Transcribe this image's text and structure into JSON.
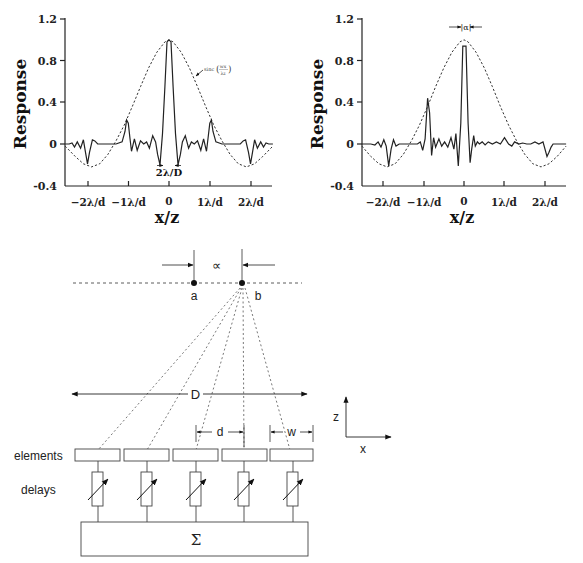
{
  "chart_data": [
    {
      "type": "line",
      "id": "left",
      "title": "",
      "xlabel": "x/z",
      "ylabel": "Response",
      "ylim": [
        -0.4,
        1.2
      ],
      "yticks": [
        1.2,
        0.8,
        0.4,
        0,
        -0.4
      ],
      "ytick_labels": [
        "1.2",
        "0.8",
        "0.4",
        "0",
        "-0.4"
      ],
      "xticks": [
        -2,
        -1,
        0,
        1,
        2
      ],
      "xtick_labels": [
        "−2λ/d",
        "−1λ/d",
        "0",
        "1λ/d",
        "2λ/d"
      ],
      "xlim": [
        -2.55,
        2.55
      ],
      "grid": false,
      "annotations": [
        {
          "text": "sinc(wx/λz)",
          "target": "envelope",
          "x": 1.0,
          "y": 0.74
        },
        {
          "text": "2λ/D",
          "x": 0,
          "y": -0.26,
          "kind": "mainlobe-width"
        }
      ],
      "series": [
        {
          "name": "envelope sinc(wx/λz)",
          "style": "dashed",
          "x": [
            -2.55,
            -2.3,
            -2.1,
            -1.9,
            -1.7,
            -1.5,
            -1.3,
            -1.1,
            -0.9,
            -0.7,
            -0.5,
            -0.3,
            -0.1,
            0,
            0.1,
            0.3,
            0.5,
            0.7,
            0.9,
            1.1,
            1.3,
            1.5,
            1.7,
            1.9,
            2.1,
            2.3,
            2.55
          ],
          "y": [
            -0.02,
            -0.12,
            -0.19,
            -0.22,
            -0.19,
            -0.1,
            0.03,
            0.18,
            0.36,
            0.55,
            0.73,
            0.88,
            0.98,
            1.0,
            0.98,
            0.88,
            0.73,
            0.55,
            0.36,
            0.18,
            0.03,
            -0.1,
            -0.19,
            -0.22,
            -0.19,
            -0.12,
            -0.02
          ]
        },
        {
          "name": "array response",
          "style": "solid",
          "x": [
            -2.55,
            -2.45,
            -2.38,
            -2.32,
            -2.25,
            -2.17,
            -2.1,
            -2.05,
            -2.0,
            -1.95,
            -1.88,
            -1.82,
            -1.75,
            -1.65,
            -1.5,
            -1.3,
            -1.15,
            -1.08,
            -1.04,
            -1.0,
            -0.96,
            -0.92,
            -0.85,
            -0.78,
            -0.7,
            -0.62,
            -0.55,
            -0.48,
            -0.4,
            -0.33,
            -0.28,
            -0.22,
            -0.16,
            -0.1,
            -0.05,
            0,
            0.05,
            0.1,
            0.16,
            0.22,
            0.28,
            0.33,
            0.4,
            0.48,
            0.55,
            0.62,
            0.7,
            0.78,
            0.85,
            0.92,
            0.96,
            1.0,
            1.04,
            1.08,
            1.15,
            1.3,
            1.5,
            1.65,
            1.75,
            1.82,
            1.88,
            1.95,
            2.0,
            2.05,
            2.1,
            2.17,
            2.25,
            2.32,
            2.38,
            2.45,
            2.55
          ],
          "y": [
            0,
            0.0,
            0.01,
            -0.03,
            0.02,
            -0.04,
            0.04,
            -0.08,
            -0.19,
            -0.08,
            0.04,
            0.03,
            0.0,
            0.0,
            0.0,
            0.0,
            0.02,
            0.12,
            0.23,
            0.2,
            0.06,
            -0.07,
            0.05,
            -0.06,
            0.03,
            0.0,
            0.02,
            -0.04,
            0.08,
            0.02,
            -0.1,
            -0.2,
            0.1,
            0.55,
            0.98,
            1.0,
            0.98,
            0.55,
            0.1,
            -0.2,
            -0.1,
            0.02,
            0.08,
            -0.04,
            0.02,
            0.0,
            0.03,
            -0.06,
            0.05,
            -0.07,
            0.06,
            0.2,
            0.23,
            0.12,
            0.02,
            0.0,
            0.0,
            0.0,
            0.0,
            0.03,
            0.04,
            -0.08,
            -0.19,
            -0.08,
            0.04,
            -0.04,
            0.02,
            -0.03,
            0.01,
            0.0,
            0.0
          ]
        }
      ]
    },
    {
      "type": "line",
      "id": "right",
      "title": "",
      "xlabel": "x/z",
      "ylabel": "Response",
      "ylim": [
        -0.4,
        1.2
      ],
      "yticks": [
        1.2,
        0.8,
        0.4,
        0,
        -0.4
      ],
      "ytick_labels": [
        "1.2",
        "0.8",
        "0.4",
        "0",
        "-0.4"
      ],
      "xticks": [
        -2,
        -1,
        0,
        1,
        2
      ],
      "xtick_labels": [
        "−2λ/d",
        "−1λ/d",
        "0",
        "1λ/d",
        "2λ/d"
      ],
      "xlim": [
        -2.52,
        2.52
      ],
      "grid": false,
      "annotations": [
        {
          "text": "|α|",
          "x": 0.1,
          "y": 1.12,
          "kind": "offset-width"
        }
      ],
      "series": [
        {
          "name": "envelope sinc",
          "style": "dashed",
          "x": [
            -2.52,
            -2.3,
            -2.1,
            -1.9,
            -1.7,
            -1.5,
            -1.3,
            -1.1,
            -0.9,
            -0.7,
            -0.5,
            -0.3,
            -0.1,
            0,
            0.1,
            0.3,
            0.5,
            0.7,
            0.9,
            1.1,
            1.3,
            1.5,
            1.7,
            1.9,
            2.1,
            2.3,
            2.52
          ],
          "y": [
            -0.02,
            -0.12,
            -0.19,
            -0.22,
            -0.19,
            -0.1,
            0.03,
            0.18,
            0.36,
            0.55,
            0.73,
            0.88,
            0.98,
            1.0,
            0.98,
            0.88,
            0.73,
            0.55,
            0.36,
            0.18,
            0.03,
            -0.1,
            -0.19,
            -0.22,
            -0.19,
            -0.12,
            -0.02
          ]
        },
        {
          "name": "steered array response",
          "style": "solid",
          "x": [
            -2.52,
            -2.3,
            -2.2,
            -2.12,
            -2.05,
            -1.98,
            -1.92,
            -1.86,
            -1.8,
            -1.74,
            -1.68,
            -1.6,
            -1.5,
            -1.3,
            -1.15,
            -1.08,
            -1.02,
            -0.96,
            -0.9,
            -0.85,
            -0.8,
            -0.75,
            -0.7,
            -0.62,
            -0.55,
            -0.48,
            -0.4,
            -0.32,
            -0.25,
            -0.2,
            -0.14,
            -0.08,
            -0.03,
            0.05,
            0.1,
            0.15,
            0.19,
            0.24,
            0.28,
            0.33,
            0.38,
            0.45,
            0.52,
            0.6,
            0.7,
            0.8,
            0.9,
            1.0,
            1.1,
            1.18,
            1.25,
            1.35,
            1.45,
            1.55,
            1.65,
            1.75,
            1.85,
            1.95,
            2.05,
            2.1,
            2.15,
            2.2,
            2.28,
            2.35,
            2.42,
            2.52
          ],
          "y": [
            0,
            0.0,
            -0.01,
            0.02,
            -0.03,
            0.04,
            -0.02,
            -0.21,
            -0.05,
            0.04,
            -0.02,
            0.0,
            0.0,
            0.0,
            0.0,
            0.02,
            -0.06,
            0.05,
            0.44,
            0.3,
            -0.11,
            0.06,
            -0.03,
            0.05,
            -0.02,
            0.02,
            -0.03,
            0.06,
            -0.05,
            0.1,
            -0.21,
            0.2,
            0.94,
            0.94,
            0.2,
            -0.18,
            -0.05,
            0.08,
            -0.02,
            0.02,
            0.0,
            0.02,
            -0.01,
            0.02,
            0.0,
            0.02,
            0.0,
            0.06,
            0.0,
            -0.02,
            0.02,
            0.0,
            0.01,
            0.0,
            0.0,
            0.02,
            0.0,
            0.02,
            -0.12,
            -0.08,
            -0.03,
            0.0,
            0.0,
            0.0,
            0.0,
            0.0
          ]
        }
      ]
    }
  ],
  "charts": {
    "left": {
      "ylabel": "Response",
      "xlabel": "x/z",
      "ytick_labels": [
        "1.2",
        "0.8",
        "0.4",
        "0",
        "-0.4"
      ],
      "xtick_labels": [
        "−2λ/d",
        "−1λ/d",
        "0",
        "1λ/d",
        "2λ/d"
      ],
      "sinc_label": "sinc",
      "sinc_num": "wx",
      "sinc_den": "λz",
      "mainlobe_label": "2λ/D"
    },
    "right": {
      "ylabel": "Response",
      "xlabel": "x/z",
      "ytick_labels": [
        "1.2",
        "0.8",
        "0.4",
        "0",
        "-0.4"
      ],
      "xtick_labels": [
        "−2λ/d",
        "−1λ/d",
        "0",
        "1λ/d",
        "2λ/d"
      ],
      "alpha_label": "|α|"
    }
  },
  "diagram": {
    "alpha_label": "∝",
    "point_a_label": "a",
    "point_b_label": "b",
    "aperture_label": "D",
    "pitch_label": "d",
    "width_label": "w",
    "axis_z_label": "z",
    "axis_x_label": "x",
    "elements_label": "elements",
    "delays_label": "delays",
    "sum_label": "Σ",
    "element_count": 5
  }
}
